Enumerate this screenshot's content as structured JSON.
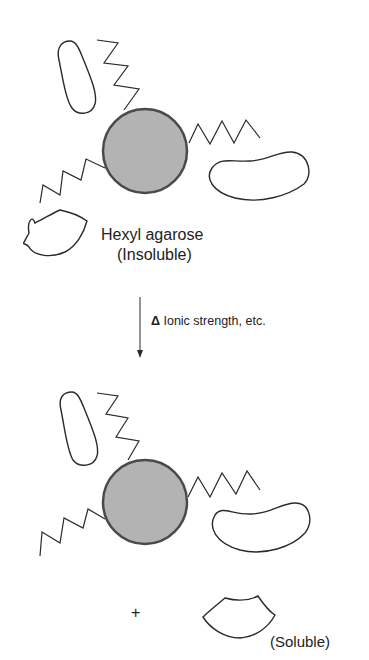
{
  "top_panel": {
    "bead_label": "Hexyl agarose",
    "state_label": "(Insoluble)"
  },
  "transition": {
    "delta_symbol": "Δ",
    "label": "Ionic strength, etc."
  },
  "bottom_panel": {
    "plus": "+",
    "released_label": "(Soluble)"
  },
  "colors": {
    "bead_fill": "#b3b3b3",
    "bead_stroke": "#4a4a4a",
    "line": "#2a2a2a"
  }
}
